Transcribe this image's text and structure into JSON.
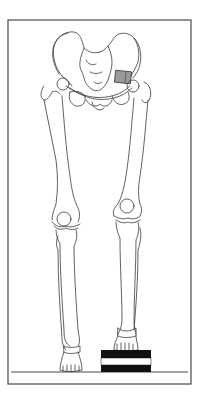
{
  "figure": {
    "colors": {
      "background": "#ffffff",
      "line": "#3a3a3a",
      "frame": "#4a4a4a",
      "graft_fill": "#9a9a9a",
      "block_black": "#111111",
      "block_white": "#ffffff"
    },
    "frame": {
      "x": 8,
      "y": 20,
      "width": 183,
      "height": 364
    },
    "ground_line_y": 372,
    "lift_block": {
      "x": 101,
      "y": 350,
      "width": 50,
      "height": 22,
      "bands": [
        "black",
        "white",
        "black"
      ]
    },
    "graft_wedge": {
      "x": 115,
      "y": 71,
      "width": 16,
      "height": 12
    },
    "elements": [
      "pelvis",
      "sacrum",
      "left-femur",
      "right-femur",
      "left-patella",
      "right-patella",
      "left-tibia",
      "left-fibula",
      "right-tibia",
      "right-fibula",
      "left-foot",
      "right-foot",
      "lift-block",
      "ground-line",
      "graft-wedge"
    ]
  }
}
